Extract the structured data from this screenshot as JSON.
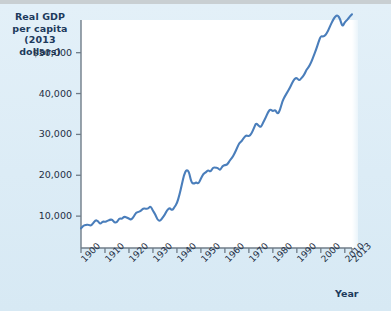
{
  "figure": {
    "background_color": "#dfeef7",
    "plot_background_color": "#ffffff",
    "line_color": "#4a7ebb",
    "axis_color": "#6f7c88",
    "text_color": "#1f2f45",
    "title_color": "#1d3a5c"
  },
  "axis_titles": {
    "y_line1": "Real GDP",
    "y_line2": "per capita",
    "y_line3": "(2013 dollars)",
    "x": "Year"
  },
  "chart_data": {
    "type": "line",
    "title": "Real GDP per capita (2013 dollars)",
    "xlabel": "Year",
    "ylabel": "Real GDP per capita (2013 dollars)",
    "xlim": [
      1900,
      2013
    ],
    "ylim": [
      2200,
      58000
    ],
    "grid": false,
    "legend": "none",
    "y_ticks": [
      10000,
      20000,
      30000,
      40000,
      50000
    ],
    "y_tick_labels": [
      "10,000",
      "20,000",
      "30,000",
      "40,000",
      "$50,000"
    ],
    "x_ticks": [
      1900,
      1910,
      1920,
      1930,
      1940,
      1950,
      1960,
      1970,
      1980,
      1990,
      2000,
      2010,
      2013
    ],
    "x_tick_labels": [
      "1900",
      "1910",
      "1920",
      "1930",
      "1940",
      "1950",
      "1960",
      "1970",
      "1980",
      "1990",
      "2000",
      "2010",
      "2013"
    ],
    "series": [
      {
        "name": "Real GDP per capita",
        "color": "#4a7ebb",
        "x": [
          1900,
          1901,
          1902,
          1903,
          1904,
          1905,
          1906,
          1907,
          1908,
          1909,
          1910,
          1911,
          1912,
          1913,
          1914,
          1915,
          1916,
          1917,
          1918,
          1919,
          1920,
          1921,
          1922,
          1923,
          1924,
          1925,
          1926,
          1927,
          1928,
          1929,
          1930,
          1931,
          1932,
          1933,
          1934,
          1935,
          1936,
          1937,
          1938,
          1939,
          1940,
          1941,
          1942,
          1943,
          1944,
          1945,
          1946,
          1947,
          1948,
          1949,
          1950,
          1951,
          1952,
          1953,
          1954,
          1955,
          1956,
          1957,
          1958,
          1959,
          1960,
          1961,
          1962,
          1963,
          1964,
          1965,
          1966,
          1967,
          1968,
          1969,
          1970,
          1971,
          1972,
          1973,
          1974,
          1975,
          1976,
          1977,
          1978,
          1979,
          1980,
          1981,
          1982,
          1983,
          1984,
          1985,
          1986,
          1987,
          1988,
          1989,
          1990,
          1991,
          1992,
          1993,
          1994,
          1995,
          1996,
          1997,
          1998,
          1999,
          2000,
          2001,
          2002,
          2003,
          2004,
          2005,
          2006,
          2007,
          2008,
          2009,
          2010,
          2011,
          2012,
          2013
        ],
        "values": [
          7000,
          7700,
          7800,
          7950,
          7600,
          8200,
          9000,
          8900,
          8000,
          8700,
          8600,
          8800,
          9100,
          9200,
          8400,
          8500,
          9500,
          9300,
          9900,
          9700,
          9400,
          9100,
          9900,
          10900,
          11000,
          11300,
          11900,
          11800,
          11800,
          12500,
          11300,
          10400,
          9000,
          8800,
          9600,
          10400,
          11600,
          12000,
          11400,
          12200,
          13100,
          15100,
          17600,
          20200,
          21400,
          20900,
          18300,
          17900,
          18300,
          17900,
          19200,
          20300,
          20700,
          21300,
          20800,
          21900,
          21900,
          21800,
          21200,
          22300,
          22500,
          22600,
          23600,
          24300,
          25300,
          26600,
          27900,
          28300,
          29300,
          29800,
          29500,
          30100,
          31400,
          32800,
          32200,
          31700,
          33000,
          34100,
          35500,
          36200,
          35600,
          36100,
          34900,
          36000,
          38200,
          39300,
          40300,
          41300,
          42500,
          43600,
          43900,
          43100,
          43900,
          44500,
          45800,
          46500,
          47700,
          49200,
          50700,
          52500,
          54100,
          53900,
          54300,
          55300,
          56700,
          57900,
          58900,
          59200,
          58300,
          56300,
          57500,
          58000,
          58800,
          59400
        ]
      }
    ],
    "annotations": []
  }
}
